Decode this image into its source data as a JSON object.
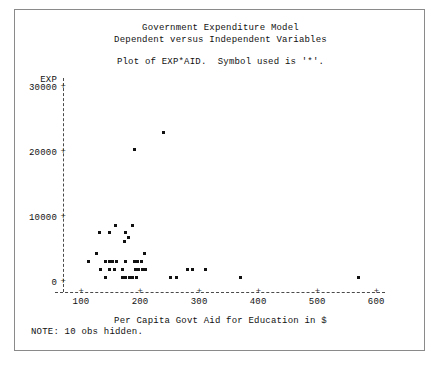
{
  "page": {
    "width": 442,
    "height": 370,
    "background": "#ffffff",
    "frame_color": "#8a8a8a",
    "text_color": "#111111",
    "point_color": "#111111",
    "axis_color": "#4a4a4a"
  },
  "titles": {
    "line1": "Government Expenditure Model",
    "line2": "Dependent versus Independent Variables",
    "subtitle": "Plot of EXP*AID.  Symbol used is '*'."
  },
  "note": {
    "text": "NOTE: 10 obs hidden."
  },
  "chart_data": {
    "type": "scatter",
    "title": "Government Expenditure Model",
    "subtitle": "Dependent versus Independent Variables",
    "annotation": "Plot of EXP*AID.  Symbol used is '*'.",
    "note": "NOTE: 10 obs hidden.",
    "symbol": "*",
    "xlabel": "Per Capita Govt Aid for Education in $",
    "ylabel": "EXP",
    "xlim": [
      75,
      610
    ],
    "ylim": [
      -1200,
      31500
    ],
    "xticks": [
      100,
      200,
      300,
      400,
      500,
      600
    ],
    "xtick_labels": [
      "100",
      "200",
      "300",
      "400",
      "500",
      "600"
    ],
    "yticks": [
      0,
      10000,
      20000,
      30000
    ],
    "ytick_labels": [
      "0",
      "10000",
      "20000",
      "30000"
    ],
    "grid": false,
    "legend": null,
    "hidden_obs": 10,
    "x": [
      240,
      190,
      158,
      187,
      131,
      148,
      176,
      180,
      181,
      174,
      127,
      208,
      112,
      142,
      148,
      154,
      160,
      176,
      190,
      196,
      202,
      133,
      148,
      157,
      170,
      192,
      198,
      204,
      210,
      280,
      288,
      310,
      142,
      170,
      176,
      182,
      188,
      194,
      252,
      262,
      370,
      570
    ],
    "y": [
      23000,
      20400,
      8700,
      8700,
      7700,
      7700,
      7700,
      6900,
      6900,
      6200,
      4400,
      4400,
      3100,
      3100,
      3100,
      3100,
      3100,
      3100,
      3100,
      3100,
      3100,
      1900,
      1900,
      1900,
      1900,
      1900,
      1900,
      1900,
      1900,
      1900,
      1900,
      1900,
      700,
      700,
      700,
      700,
      700,
      700,
      700,
      700,
      700,
      700
    ]
  },
  "axes": {
    "y_axis_label": "EXP",
    "tick_symbol": "+",
    "x_axis_title": "Per Capita Govt Aid for Education in $"
  }
}
